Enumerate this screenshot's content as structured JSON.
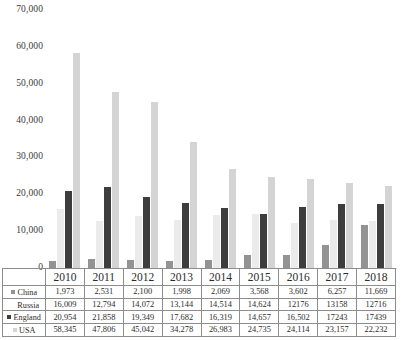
{
  "chart_data": {
    "type": "bar",
    "title": "",
    "subtitle": "",
    "xlabel": "",
    "ylabel": "",
    "ylim": [
      0,
      70000
    ],
    "ytick_step": 10000,
    "yticks": [
      "70,000",
      "60,000",
      "50,000",
      "40,000",
      "30,000",
      "20,000",
      "10,000",
      "0"
    ],
    "grid": false,
    "legend_position": "table-left-column",
    "categories": [
      "2010",
      "2011",
      "2012",
      "2013",
      "2014",
      "2015",
      "2016",
      "2017",
      "2018"
    ],
    "series": [
      {
        "name": "China",
        "color": "#939393",
        "values": [
          1973,
          2531,
          2100,
          1998,
          2069,
          3568,
          3602,
          6257,
          11669
        ],
        "labels": [
          "1,973",
          "2,531",
          "2,100",
          "1,998",
          "2,069",
          "3,568",
          "3,602",
          "6,257",
          "11,669"
        ]
      },
      {
        "name": "Russia",
        "color": "#ebebeb",
        "values": [
          16009,
          12794,
          14072,
          13144,
          14514,
          14624,
          12176,
          13158,
          12716
        ],
        "labels": [
          "16,009",
          "12,794",
          "14,072",
          "13,144",
          "14,514",
          "14,624",
          "12176",
          "13158",
          "12716"
        ]
      },
      {
        "name": "England",
        "color": "#3d3d3d",
        "values": [
          20954,
          21858,
          19349,
          17682,
          16319,
          14657,
          16502,
          17243,
          17439
        ],
        "labels": [
          "20,954",
          "21,858",
          "19,349",
          "17,682",
          "16,319",
          "14,657",
          "16,502",
          "17243",
          "17439"
        ]
      },
      {
        "name": "USA",
        "color": "#d4d4d4",
        "values": [
          58345,
          47806,
          45042,
          34278,
          26983,
          24735,
          24114,
          23157,
          22232
        ],
        "labels": [
          "58,345",
          "47,806",
          "45,042",
          "34,278",
          "26,983",
          "24,735",
          "24,114",
          "23,157",
          "22,232"
        ]
      }
    ]
  },
  "table": {
    "corner_label": "",
    "year_header": [
      "2010",
      "2011",
      "2012",
      "2013",
      "2014",
      "2015",
      "2016",
      "2017",
      "2018"
    ],
    "rows": [
      {
        "label": "China",
        "swatch": "#939393",
        "has_swatch": true,
        "cells": [
          "1,973",
          "2,531",
          "2,100",
          "1,998",
          "2,069",
          "3,568",
          "3,602",
          "6,257",
          "11,669"
        ]
      },
      {
        "label": "Russia",
        "swatch": "#f2f2f2",
        "has_swatch": false,
        "cells": [
          "16,009",
          "12,794",
          "14,072",
          "13,144",
          "14,514",
          "14,624",
          "12176",
          "13158",
          "12716"
        ]
      },
      {
        "label": "England",
        "swatch": "#3d3d3d",
        "has_swatch": true,
        "cells": [
          "20,954",
          "21,858",
          "19,349",
          "17,682",
          "16,319",
          "14,657",
          "16,502",
          "17243",
          "17439"
        ]
      },
      {
        "label": "USA",
        "swatch": "#d4d4d4",
        "has_swatch": true,
        "cells": [
          "58,345",
          "47,806",
          "45,042",
          "34,278",
          "26,983",
          "24,735",
          "24,114",
          "23,157",
          "22,232"
        ]
      }
    ]
  }
}
